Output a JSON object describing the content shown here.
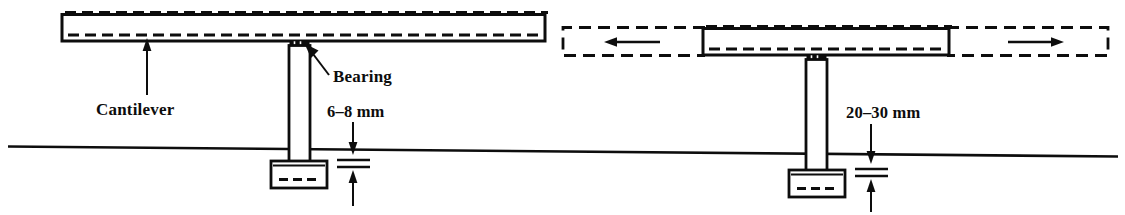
{
  "figure": {
    "type": "engineering-diagram",
    "background_color": "#ffffff",
    "line_color": "#0d0d0d"
  },
  "labels": {
    "cantilever": "Cantilever",
    "bearing": "Bearing",
    "gap_left": "6–8 mm",
    "gap_right": "20–30 mm"
  },
  "annotations": {
    "left_leader_target": "Cantilever deck soffit",
    "bearing_leader_target": "Elastomeric bearing at pier head",
    "left_gap_value": "6–8 mm",
    "right_gap_value": "20–30 mm",
    "movement_arrow_left_direction": "left",
    "movement_arrow_right_direction": "right"
  },
  "icons": {
    "arrow_up": "arrow-up-icon",
    "arrow_down": "arrow-down-icon",
    "arrow_left": "arrow-left-icon",
    "arrow_right": "arrow-right-icon",
    "leader_line": "leader-line-icon"
  },
  "geometry": {
    "ground_line": {
      "x1": 8,
      "y1": 146,
      "x2": 1118,
      "y2": 156
    },
    "left_deck": {
      "x": 62,
      "y": 14,
      "w": 483,
      "h": 27
    },
    "right_deck": {
      "x": 703,
      "y": 28,
      "w": 246,
      "h": 27
    },
    "right_deck_ghost_left": {
      "x": 562,
      "y": 26,
      "w": 148,
      "h": 30
    },
    "right_deck_ghost_right": {
      "x": 942,
      "y": 26,
      "w": 166,
      "h": 30
    },
    "left_column": {
      "x": 289,
      "y": 44,
      "w": 21,
      "h": 114
    },
    "right_column": {
      "x": 806,
      "y": 56,
      "w": 21,
      "h": 109
    },
    "left_footing": {
      "x": 271,
      "y": 161,
      "w": 56,
      "h": 27
    },
    "right_footing": {
      "x": 789,
      "y": 170,
      "w": 56,
      "h": 27
    }
  }
}
